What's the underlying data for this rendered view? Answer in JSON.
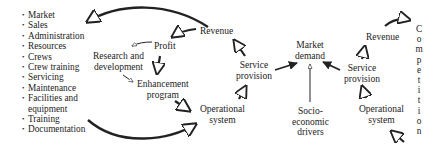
{
  "diagram": {
    "type": "causal-loop",
    "resource_list": [
      "Market",
      "Sales",
      "Administration",
      "Resources",
      "Crews",
      "Crew training",
      "Servicing",
      "Maintenance",
      "Facilities and",
      "equipment",
      "Training",
      "Documentation"
    ],
    "left_loop": {
      "revenue": "Revenue",
      "profit": "Profit",
      "research_1": "Research and",
      "research_2": "development",
      "enhancement_1": "Enhancement",
      "enhancement_2": "program",
      "operational_1": "Operational",
      "operational_2": "system",
      "service_1": "Service",
      "service_2": "provision"
    },
    "center": {
      "market_1": "Market",
      "market_2": "demand",
      "socio_1": "Socio-",
      "socio_2": "economic",
      "socio_3": "drivers"
    },
    "right_loop": {
      "revenue": "Revenue",
      "service_1": "Service",
      "service_2": "provision",
      "operational_1": "Operational",
      "operational_2": "system"
    },
    "competition": [
      "C",
      "o",
      "m",
      "p",
      "e",
      "t",
      "i",
      "t",
      "i",
      "o",
      "n"
    ]
  }
}
